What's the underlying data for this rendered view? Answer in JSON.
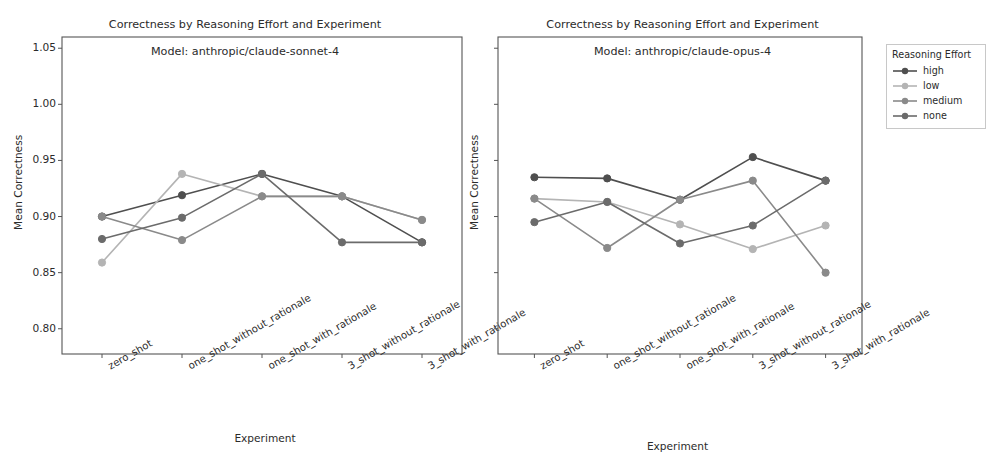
{
  "figure": {
    "background": "#ffffff",
    "text_color": "#2b2b2b"
  },
  "legend": {
    "title": "Reasoning Effort",
    "entries": [
      {
        "label": "high",
        "color": "#4f4f4f"
      },
      {
        "label": "low",
        "color": "#b4b4b4"
      },
      {
        "label": "medium",
        "color": "#8a8a8a"
      },
      {
        "label": "none",
        "color": "#6b6b6b"
      }
    ]
  },
  "chart_data": [
    {
      "type": "line",
      "panel": "left",
      "title": "Correctness by Reasoning Effort and Experiment\nModel: anthropic/claude-sonnet-4",
      "title_line1": "Correctness by Reasoning Effort and Experiment",
      "title_line2": "Model: anthropic/claude-sonnet-4",
      "xlabel": "Experiment",
      "ylabel": "Mean Correctness",
      "categories": [
        "zero_shot",
        "one_shot_without_rationale",
        "one_shot_with_rationale",
        "3_shot_without_rationale",
        "3_shot_with_rationale"
      ],
      "ylim": [
        0.7775,
        1.06
      ],
      "yticks": [
        "0.80",
        "0.85",
        "0.90",
        "0.95",
        "1.00",
        "1.05"
      ],
      "ytickvalues": [
        0.8,
        0.85,
        0.9,
        0.95,
        1.0,
        1.05
      ],
      "grid": false,
      "legend_position": "outside right",
      "series": [
        {
          "name": "high",
          "color": "#4f4f4f",
          "values": [
            0.9,
            0.919,
            0.938,
            0.918,
            0.877
          ]
        },
        {
          "name": "low",
          "color": "#b4b4b4",
          "values": [
            0.859,
            0.938,
            0.918,
            0.918,
            0.897
          ]
        },
        {
          "name": "medium",
          "color": "#8a8a8a",
          "values": [
            0.9,
            0.879,
            0.918,
            0.918,
            0.897
          ]
        },
        {
          "name": "none",
          "color": "#6b6b6b",
          "values": [
            0.88,
            0.899,
            0.938,
            0.877,
            0.877
          ]
        }
      ]
    },
    {
      "type": "line",
      "panel": "right",
      "title": "Correctness by Reasoning Effort and Experiment\nModel: anthropic/claude-opus-4",
      "title_line1": "Correctness by Reasoning Effort and Experiment",
      "title_line2": "Model: anthropic/claude-opus-4",
      "xlabel": "Experiment",
      "ylabel": "Mean Correctness",
      "categories": [
        "zero_shot",
        "one_shot_without_rationale",
        "one_shot_with_rationale",
        "3_shot_without_rationale",
        "3_shot_with_rationale"
      ],
      "ylim": [
        0.7775,
        1.06
      ],
      "yticks": [],
      "ytickvalues": [
        0.8,
        0.85,
        0.9,
        0.95,
        1.0,
        1.05
      ],
      "grid": false,
      "legend_position": "outside right",
      "series": [
        {
          "name": "high",
          "color": "#4f4f4f",
          "values": [
            0.935,
            0.934,
            0.915,
            0.953,
            0.932
          ]
        },
        {
          "name": "low",
          "color": "#b4b4b4",
          "values": [
            0.916,
            0.913,
            0.893,
            0.871,
            0.892
          ]
        },
        {
          "name": "medium",
          "color": "#8a8a8a",
          "values": [
            0.916,
            0.872,
            0.915,
            0.932,
            0.85
          ]
        },
        {
          "name": "none",
          "color": "#6b6b6b",
          "values": [
            0.895,
            0.913,
            0.876,
            0.892,
            0.932
          ]
        }
      ]
    }
  ]
}
